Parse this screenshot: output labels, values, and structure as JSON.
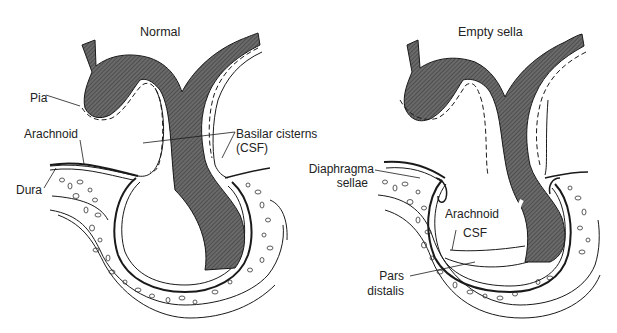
{
  "panels": [
    {
      "id": "normal",
      "title": "Normal",
      "labels": {
        "pia": "Pia",
        "arachnoid": "Arachnoid",
        "dura": "Dura",
        "basilar_cisterns_1": "Basilar cisterns",
        "basilar_cisterns_2": "(CSF)"
      }
    },
    {
      "id": "empty-sella",
      "title": "Empty sella",
      "labels": {
        "diaphragma_1": "Diaphragma",
        "diaphragma_2": "sellae",
        "arachnoid": "Arachnoid",
        "csf": "CSF",
        "pars_1": "Pars",
        "pars_2": "distalis"
      }
    }
  ],
  "colors": {
    "stalk_fill": "#5a5a5a",
    "line": "#1a1a1a",
    "background": "#ffffff"
  }
}
